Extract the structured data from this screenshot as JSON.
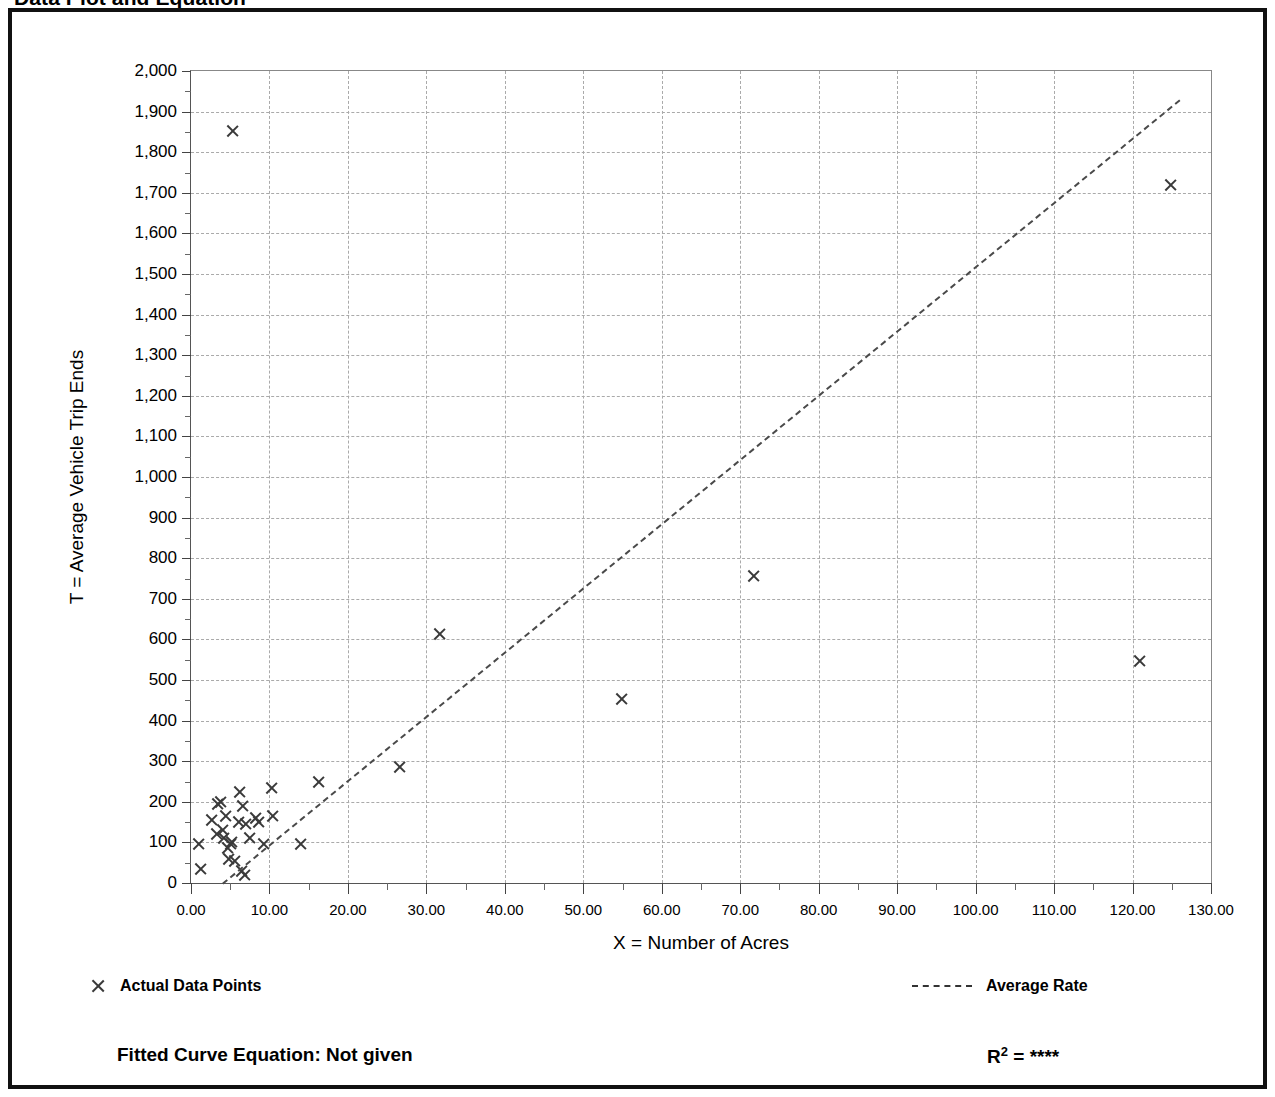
{
  "page": {
    "title": "Data Plot and Equation"
  },
  "legend": {
    "points_label": "Actual Data Points",
    "rate_label": "Average Rate",
    "point_marker_icon": "x-marker-icon",
    "rate_line_icon": "dashed-line-icon"
  },
  "equation": {
    "fitted_label": "Fitted Curve Equation:  Not given",
    "r2_prefix": "R",
    "r2_exponent": "2",
    "r2_equals": " = ",
    "r2_value": "****"
  },
  "chart_data": {
    "type": "scatter",
    "title": "Data Plot and Equation",
    "xlabel": "X = Number of Acres",
    "ylabel": "T = Average Vehicle Trip Ends",
    "xlim": [
      0,
      130
    ],
    "ylim": [
      0,
      2000
    ],
    "x_tick_step": 10,
    "y_tick_step": 100,
    "x_minor_per_major": 2,
    "y_minor_per_major": 2,
    "grid": true,
    "legend_position": "below-plot",
    "xticks": [
      "0.00",
      "10.00",
      "20.00",
      "30.00",
      "40.00",
      "50.00",
      "60.00",
      "70.00",
      "80.00",
      "90.00",
      "100.00",
      "110.00",
      "120.00",
      "130.00"
    ],
    "yticks": [
      "0",
      "100",
      "200",
      "300",
      "400",
      "500",
      "600",
      "700",
      "800",
      "900",
      "1,000",
      "1,100",
      "1,200",
      "1,300",
      "1,400",
      "1,500",
      "1,600",
      "1,700",
      "1,800",
      "1,900",
      "2,000"
    ],
    "series": [
      {
        "name": "Actual Data Points",
        "marker": "x",
        "points": [
          [
            0.9,
            95
          ],
          [
            1.2,
            35
          ],
          [
            2.6,
            155
          ],
          [
            3.2,
            120
          ],
          [
            3.4,
            195
          ],
          [
            3.8,
            200
          ],
          [
            4.0,
            130
          ],
          [
            4.2,
            110
          ],
          [
            4.4,
            165
          ],
          [
            4.6,
            85
          ],
          [
            4.8,
            60
          ],
          [
            5.0,
            95
          ],
          [
            5.2,
            100
          ],
          [
            5.3,
            1851
          ],
          [
            5.6,
            55
          ],
          [
            6.0,
            150
          ],
          [
            6.2,
            225
          ],
          [
            6.4,
            30
          ],
          [
            6.6,
            190
          ],
          [
            6.8,
            20
          ],
          [
            7.0,
            145
          ],
          [
            7.4,
            110
          ],
          [
            8.2,
            160
          ],
          [
            8.6,
            150
          ],
          [
            9.2,
            95
          ],
          [
            10.2,
            235
          ],
          [
            10.4,
            165
          ],
          [
            13.9,
            95
          ],
          [
            16.2,
            250
          ],
          [
            26.6,
            285
          ],
          [
            31.7,
            613
          ],
          [
            54.9,
            452
          ],
          [
            71.7,
            757
          ],
          [
            120.9,
            548
          ],
          [
            124.9,
            1718
          ]
        ]
      },
      {
        "name": "Average Rate",
        "type": "line",
        "style": "dashed",
        "from": [
          4.0,
          0
        ],
        "to": [
          126.0,
          1930
        ]
      }
    ]
  }
}
